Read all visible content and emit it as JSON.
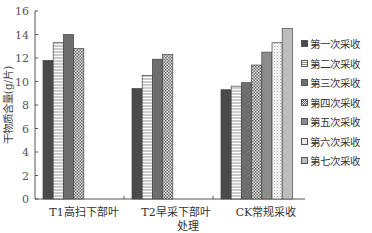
{
  "chart_data": {
    "type": "bar",
    "title": "",
    "xlabel": "处理",
    "ylabel": "干物质含量(g/片)",
    "ylim": [
      0,
      16
    ],
    "yticks": [
      0,
      2,
      4,
      6,
      8,
      10,
      12,
      14,
      16
    ],
    "grid": false,
    "legend_position": "right",
    "categories": [
      "T1高扫下部叶",
      "T2早采下部叶",
      "CK常规采收"
    ],
    "series": [
      {
        "name": "第一次采收",
        "values": [
          11.8,
          9.4,
          9.3
        ],
        "color": "#4a4a4a",
        "pattern": "solid"
      },
      {
        "name": "第二次采收",
        "values": [
          13.3,
          10.5,
          9.6
        ],
        "color": "#ffffff",
        "pattern": "hlines"
      },
      {
        "name": "第三次采收",
        "values": [
          14.0,
          11.9,
          9.9
        ],
        "color": "#6e6e6e",
        "pattern": "solid"
      },
      {
        "name": "第四次采收",
        "values": [
          12.8,
          12.3,
          11.4
        ],
        "color": "#cfcfcf",
        "pattern": "checker"
      },
      {
        "name": "第五次采收",
        "values": [
          null,
          null,
          12.5
        ],
        "color": "#8c8c8c",
        "pattern": "solid"
      },
      {
        "name": "第六次采收",
        "values": [
          null,
          null,
          13.3
        ],
        "color": "#e6e6e6",
        "pattern": "dots"
      },
      {
        "name": "第七次采收",
        "values": [
          null,
          null,
          14.5
        ],
        "color": "#bdbdbd",
        "pattern": "solid"
      }
    ]
  }
}
